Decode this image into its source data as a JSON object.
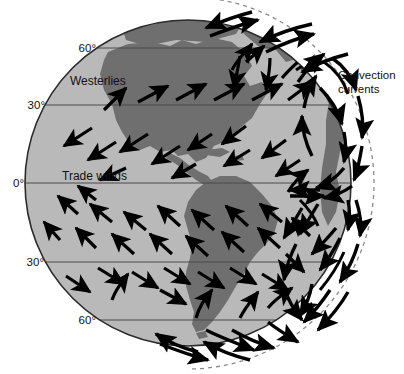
{
  "diagram": {
    "type": "earth-wind-convection-diagram",
    "background_color": "#ffffff"
  },
  "globe": {
    "name": "earth-globe",
    "center": {
      "x": 188,
      "y": 183
    },
    "radius": 163,
    "ocean_color": "#b9b9b9",
    "land_color": "#6f6f6f",
    "outline_color": "#2b2b2b"
  },
  "latitude_lines": [
    {
      "label": "60°",
      "hemisphere": "north",
      "y": 48,
      "label_x": 96,
      "label_y": 52
    },
    {
      "label": "30°",
      "hemisphere": "north",
      "y": 105,
      "label_x": 45,
      "label_y": 109
    },
    {
      "label": "0°",
      "hemisphere": "equator",
      "y": 183,
      "label_x": 16,
      "label_y": 187
    },
    {
      "label": "30°",
      "hemisphere": "south",
      "y": 262,
      "label_x": 36,
      "label_y": 266
    },
    {
      "label": "60°",
      "hemisphere": "south",
      "y": 320,
      "label_x": 85,
      "label_y": 324
    }
  ],
  "wind_labels": [
    {
      "text": "Westerlies",
      "x": 70,
      "y": 85,
      "name": "westerlies-label"
    },
    {
      "text": "Trade winds",
      "x": 62,
      "y": 180,
      "name": "trade-winds-label"
    }
  ],
  "convection_label": {
    "name": "convection-currents-label",
    "line1": "Convection",
    "line2": "currents",
    "x": 338,
    "y": 79
  },
  "atmosphere": {
    "name": "atmosphere-boundary",
    "style": "dashed",
    "color": "#8a8a8a",
    "outer_radius": 186
  },
  "wind_bands": [
    {
      "name": "polar-easterlies-north",
      "lat_range": "60-90N",
      "direction": "southwest"
    },
    {
      "name": "westerlies-north",
      "lat_range": "30-60N",
      "direction": "northeast"
    },
    {
      "name": "trade-winds-north",
      "lat_range": "0-30N",
      "direction": "southwest"
    },
    {
      "name": "trade-winds-south",
      "lat_range": "0-30S",
      "direction": "northwest"
    },
    {
      "name": "westerlies-south",
      "lat_range": "30-60S",
      "direction": "southeast"
    }
  ],
  "convection_cells": [
    {
      "name": "hadley-cell-north",
      "position": "equator-to-30N"
    },
    {
      "name": "ferrel-cell-north",
      "position": "30N-to-60N"
    },
    {
      "name": "polar-cell-north",
      "position": "60N-to-pole"
    },
    {
      "name": "hadley-cell-south",
      "position": "equator-to-30S"
    },
    {
      "name": "ferrel-cell-south",
      "position": "30S-to-60S"
    },
    {
      "name": "polar-cell-south",
      "position": "60S-to-pole"
    }
  ]
}
